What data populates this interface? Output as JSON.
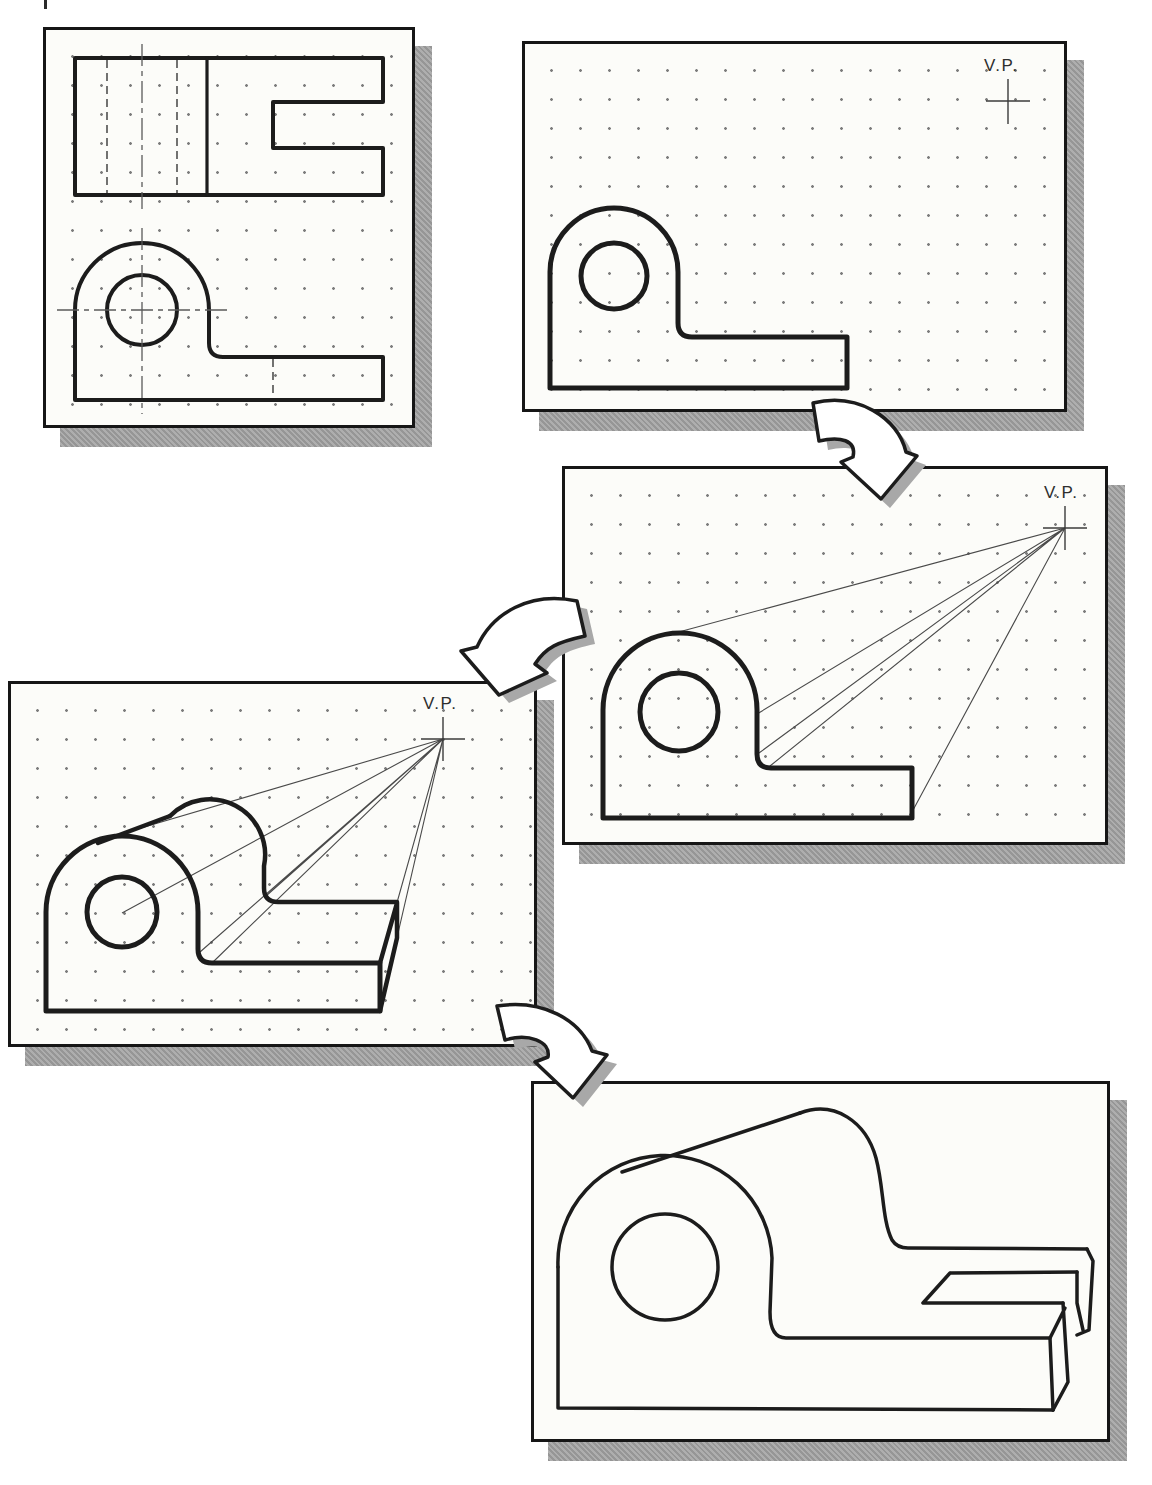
{
  "colors": {
    "ink": "#1c1c1c",
    "paper": "#fcfcf9",
    "shadow": "#a2a2a2",
    "page_background": "#ffffff"
  },
  "figure": {
    "type": "instructional-diagram",
    "panels": {
      "step1_orthographic_views": {
        "content": "top view and front view of bracket on dot grid"
      },
      "step2_front_view_with_vp": {
        "vp_label": "V.P."
      },
      "step3_projection_lines_to_vp": {
        "vp_label": "V.P."
      },
      "step4_depth_construction": {
        "vp_label": "V.P."
      },
      "step5_final_perspective": {
        "content": "finished perspective pictorial of bracket with slotted base"
      }
    },
    "connector_arrows": 3
  }
}
